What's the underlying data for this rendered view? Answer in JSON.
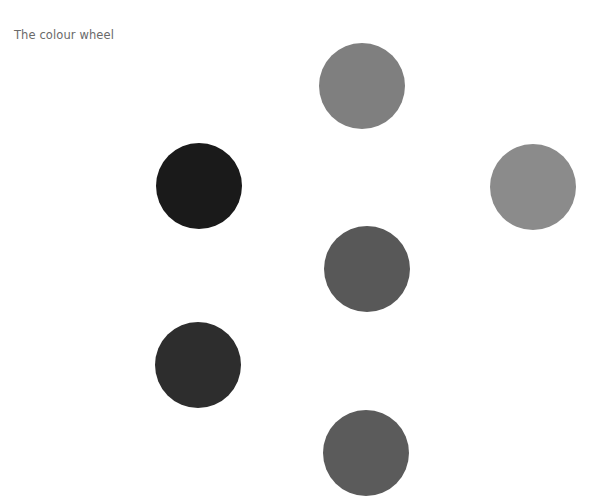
{
  "title": "The colour wheel",
  "circles": [
    {
      "id": "top",
      "cx": 362,
      "cy": 86,
      "r": 43,
      "color": "#7f7f7f"
    },
    {
      "id": "upper-left",
      "cx": 199,
      "cy": 186,
      "r": 43,
      "color": "#1a1a1a"
    },
    {
      "id": "right",
      "cx": 533,
      "cy": 187,
      "r": 43,
      "color": "#8b8b8b"
    },
    {
      "id": "center",
      "cx": 367,
      "cy": 269,
      "r": 43,
      "color": "#585858"
    },
    {
      "id": "lower-left",
      "cx": 198,
      "cy": 365,
      "r": 43,
      "color": "#2d2d2d"
    },
    {
      "id": "bottom",
      "cx": 366,
      "cy": 453,
      "r": 43,
      "color": "#5b5b5b"
    }
  ]
}
